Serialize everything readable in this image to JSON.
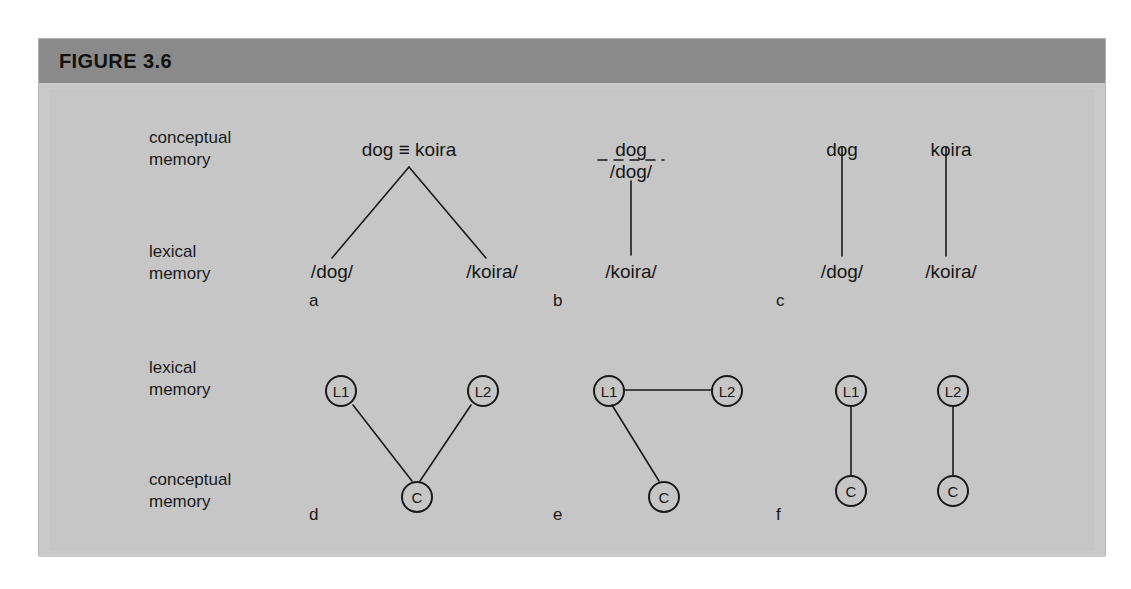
{
  "figure": {
    "title": "FIGURE 3.6",
    "header_bg": "#8a8a8a",
    "plate_bg": "#c6c6c6",
    "ink": "#161616"
  },
  "row_labels": {
    "top_upper": "conceptual\nmemory",
    "top_lower": "lexical\nmemory",
    "bottom_upper": "lexical\nmemory",
    "bottom_lower": "conceptual\nmemory",
    "conceptual_line1": "conceptual",
    "conceptual_line2": "memory",
    "lexical_line1": "lexical",
    "lexical_line2": "memory"
  },
  "panels": {
    "a": {
      "letter": "a",
      "top_node": "dog ≡ koira",
      "left_leaf": "/dog/",
      "right_leaf": "/koira/"
    },
    "b": {
      "letter": "b",
      "top_node": "dog",
      "mid_node": "/dog/",
      "bottom_node": "/koira/",
      "separator": "dashed"
    },
    "c": {
      "letter": "c",
      "left_top": "dog",
      "left_bottom": "/dog/",
      "right_top": "koira",
      "right_bottom": "/koira/"
    },
    "d": {
      "letter": "d",
      "node_l1": "L1",
      "node_l2": "L2",
      "node_c": "C"
    },
    "e": {
      "letter": "e",
      "node_l1": "L1",
      "node_l2": "L2",
      "node_c": "C"
    },
    "f": {
      "letter": "f",
      "node_l1": "L1",
      "node_l2": "L2",
      "node_c1": "C",
      "node_c2": "C"
    }
  }
}
